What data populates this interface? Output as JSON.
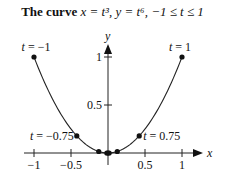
{
  "title": {
    "prefix": "The curve",
    "eq": "x = t³, y = t⁶, −1 ≤ t ≤ 1"
  },
  "chart_data": {
    "type": "line",
    "xlabel": "x",
    "ylabel": "y",
    "xlim": [
      -1.1,
      1.2
    ],
    "ylim": [
      -0.05,
      1.15
    ],
    "x_ticks": [
      -1,
      -0.5,
      0.5,
      1
    ],
    "x_tick_labels": [
      "−1",
      "−0.5",
      "0.5",
      "1"
    ],
    "y_ticks": [
      0.5,
      1
    ],
    "y_tick_labels": [
      "0.5",
      "1"
    ],
    "grid": false,
    "legend": null,
    "series": [
      {
        "name": "parametric curve",
        "parameter": "t",
        "t_range": [
          -1,
          1
        ],
        "x_expr": "t^3",
        "y_expr": "t^6"
      }
    ],
    "marked_points": [
      {
        "t": -1,
        "x": -1,
        "y": 1,
        "label": "t = −1"
      },
      {
        "t": -0.75,
        "x": -0.4219,
        "y": 0.178,
        "label": "t = −0.75"
      },
      {
        "t": -0.5,
        "x": -0.125,
        "y": 0.0156,
        "label": ""
      },
      {
        "t": -0.25,
        "x": -0.0156,
        "y": 0.0002,
        "label": ""
      },
      {
        "t": 0,
        "x": 0,
        "y": 0,
        "label": ""
      },
      {
        "t": 0.25,
        "x": 0.0156,
        "y": 0.0002,
        "label": ""
      },
      {
        "t": 0.5,
        "x": 0.125,
        "y": 0.0156,
        "label": ""
      },
      {
        "t": 0.75,
        "x": 0.4219,
        "y": 0.178,
        "label": "t = 0.75"
      },
      {
        "t": 1,
        "x": 1,
        "y": 1,
        "label": "t = 1"
      }
    ]
  }
}
